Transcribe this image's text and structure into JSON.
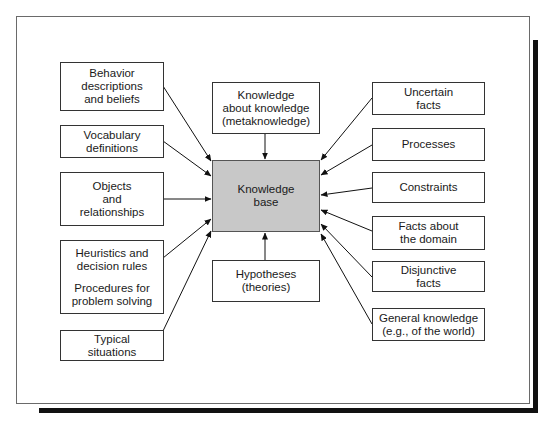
{
  "diagram": {
    "center": {
      "label_line1": "Knowledge",
      "label_line2": "base",
      "fill": "#c8c8c8"
    },
    "top": {
      "line1": "Knowledge",
      "line2": "about knowledge",
      "line3": "(metaknowledge)",
      "arrow": "bidirectional"
    },
    "bottom": {
      "line1": "Hypotheses",
      "line2": "(theories)"
    },
    "left": [
      {
        "lines": [
          "Behavior",
          "descriptions",
          "and beliefs"
        ]
      },
      {
        "lines": [
          "Vocabulary",
          "definitions"
        ]
      },
      {
        "lines": [
          "Objects",
          "and",
          "relationships"
        ]
      },
      {
        "lines": [
          "Heuristics and",
          "decision rules"
        ],
        "lines2": [
          "Procedures for",
          "problem solving"
        ]
      },
      {
        "lines": [
          "Typical",
          "situations"
        ]
      }
    ],
    "right": [
      {
        "lines": [
          "Uncertain",
          "facts"
        ]
      },
      {
        "lines": [
          "Processes"
        ]
      },
      {
        "lines": [
          "Constraints"
        ]
      },
      {
        "lines": [
          "Facts about",
          "the domain"
        ]
      },
      {
        "lines": [
          "Disjunctive",
          "facts"
        ]
      },
      {
        "lines": [
          "General knowledge",
          "(e.g., of the world)"
        ]
      }
    ]
  }
}
